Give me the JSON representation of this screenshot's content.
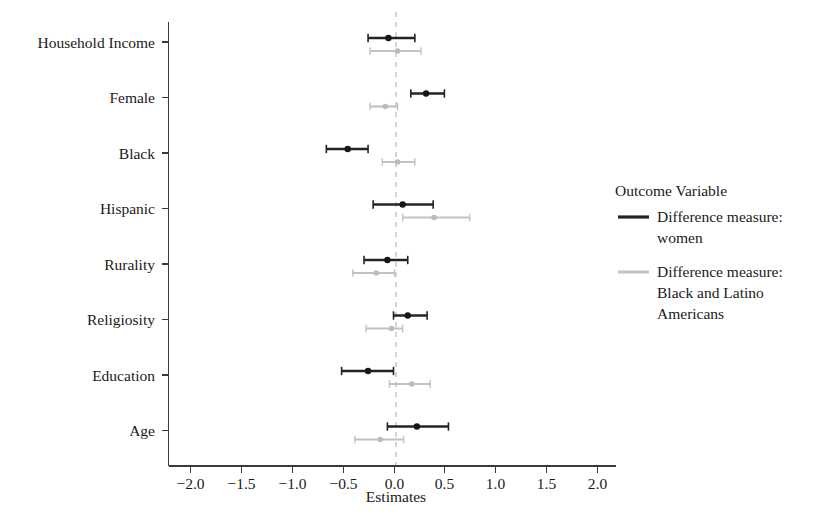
{
  "chart_data": {
    "type": "scatter",
    "subtype": "coefficient-forest-plot",
    "title": "",
    "xlabel": "Estimates",
    "ylabel": "",
    "xlim": [
      -2.25,
      2.3
    ],
    "xticks": [
      -2.0,
      -1.5,
      -1.0,
      -0.5,
      0.0,
      0.5,
      1.0,
      1.5,
      2.0
    ],
    "xtick_labels": [
      "-2.0",
      "-1.5",
      "-1.0",
      "-0.5",
      "0.0",
      "0.5",
      "1.0",
      "1.5",
      "2.0"
    ],
    "categories": [
      "Household Income",
      "Female",
      "Black",
      "Hispanic",
      "Rurality",
      "Religiosity",
      "Education",
      "Age"
    ],
    "grid": false,
    "reference_line": 0.0,
    "reference_line_style": "dashed",
    "legend_title": "Outcome Variable",
    "legend_position": "right",
    "series": [
      {
        "name": "Difference measure: women",
        "color": "#232323",
        "estimates": [
          -0.05,
          0.32,
          -0.45,
          0.09,
          -0.06,
          0.14,
          -0.25,
          0.23
        ],
        "ci_low": [
          -0.25,
          0.17,
          -0.66,
          -0.2,
          -0.29,
          0.0,
          -0.51,
          -0.06
        ],
        "ci_high": [
          0.21,
          0.5,
          -0.25,
          0.39,
          0.14,
          0.33,
          0.0,
          0.54
        ]
      },
      {
        "name": "Difference measure: Black and Latino Americans",
        "color": "#c2c2c2",
        "estimates": [
          0.04,
          -0.08,
          0.04,
          0.4,
          -0.17,
          -0.02,
          0.18,
          -0.13
        ],
        "ci_low": [
          -0.23,
          -0.23,
          -0.11,
          0.09,
          -0.4,
          -0.27,
          -0.04,
          -0.38
        ],
        "ci_high": [
          0.27,
          0.04,
          0.21,
          0.75,
          0.01,
          0.09,
          0.36,
          0.1
        ]
      }
    ]
  },
  "legend": {
    "title": "Outcome Variable",
    "entries": [
      {
        "label_line1": "Difference measure:",
        "label_line2": "women",
        "label_line3": "",
        "color": "#232323"
      },
      {
        "label_line1": "Difference measure:",
        "label_line2": "Black and Latino",
        "label_line3": "Americans",
        "color": "#c2c2c2"
      }
    ]
  },
  "axes": {
    "x_title": "Estimates"
  }
}
